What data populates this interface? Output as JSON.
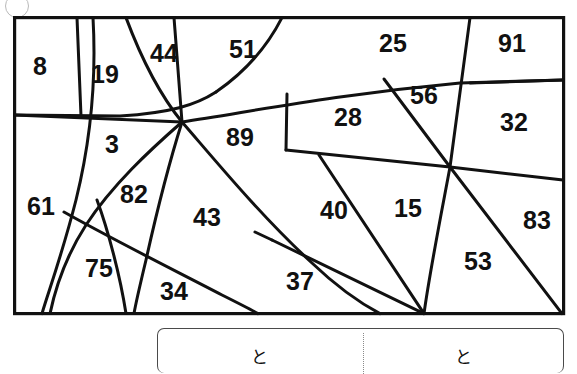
{
  "figure": {
    "frame": {
      "x": 13,
      "y": 16,
      "width": 552,
      "height": 299,
      "stroke": "#111111",
      "stroke_width": 3.2
    },
    "line_color": "#111111",
    "background": "#ffffff",
    "regions": [
      {
        "id": "r8",
        "label": "8",
        "x": 40,
        "y": 68
      },
      {
        "id": "r19",
        "label": "19",
        "x": 105,
        "y": 76
      },
      {
        "id": "r44",
        "label": "44",
        "x": 164,
        "y": 55
      },
      {
        "id": "r51",
        "label": "51",
        "x": 243,
        "y": 51
      },
      {
        "id": "r25",
        "label": "25",
        "x": 393,
        "y": 45
      },
      {
        "id": "r91",
        "label": "91",
        "x": 512,
        "y": 45
      },
      {
        "id": "r56",
        "label": "56",
        "x": 424,
        "y": 97
      },
      {
        "id": "r32",
        "label": "32",
        "x": 514,
        "y": 124
      },
      {
        "id": "r28",
        "label": "28",
        "x": 348,
        "y": 119
      },
      {
        "id": "r89",
        "label": "89",
        "x": 240,
        "y": 139
      },
      {
        "id": "r3",
        "label": "3",
        "x": 112,
        "y": 146
      },
      {
        "id": "r61",
        "label": "61",
        "x": 41,
        "y": 208
      },
      {
        "id": "r82",
        "label": "82",
        "x": 134,
        "y": 196
      },
      {
        "id": "r43",
        "label": "43",
        "x": 207,
        "y": 219
      },
      {
        "id": "r40",
        "label": "40",
        "x": 334,
        "y": 212
      },
      {
        "id": "r15",
        "label": "15",
        "x": 408,
        "y": 210
      },
      {
        "id": "r83",
        "label": "83",
        "x": 537,
        "y": 222
      },
      {
        "id": "r53",
        "label": "53",
        "x": 478,
        "y": 263
      },
      {
        "id": "r37",
        "label": "37",
        "x": 300,
        "y": 283
      },
      {
        "id": "r75",
        "label": "75",
        "x": 99,
        "y": 270
      },
      {
        "id": "r34",
        "label": "34",
        "x": 174,
        "y": 293
      }
    ]
  },
  "answer_box": {
    "left_cell": "と",
    "right_cell": "と"
  }
}
